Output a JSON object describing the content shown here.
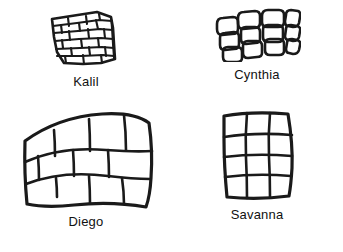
{
  "figure": {
    "background_color": "#ffffff",
    "ink_color": "#1a1a1a",
    "panel_count": 4,
    "panels": [
      {
        "id": "kalil",
        "label": "Kalil",
        "position": "top-left",
        "drawing": "hand-drawn tilted brick wall grid",
        "size": "small",
        "rows": 5,
        "columns": 4,
        "tile_style": "irregular rectangular bricks, offset rows, slanted",
        "label_position": "below"
      },
      {
        "id": "cynthia",
        "label": "Cynthia",
        "position": "top-right",
        "drawing": "hand-drawn skewed grid of rounded tiles in perspective",
        "size": "small",
        "rows": 3,
        "columns": 4,
        "tile_style": "rounded pebble-like tiles, sheared parallelogram layout",
        "label_position": "below"
      },
      {
        "id": "diego",
        "label": "Diego",
        "position": "bottom-left",
        "drawing": "hand-drawn large wavy brick wall grid",
        "size": "large",
        "rows": 3,
        "columns": 4,
        "tile_style": "large wavy rectangular bricks, offset rows",
        "label_position": "below"
      },
      {
        "id": "savanna",
        "label": "Savanna",
        "position": "bottom-right",
        "drawing": "hand-drawn square lattice grid",
        "size": "medium",
        "rows": 4,
        "columns": 3,
        "tile_style": "aligned square cells, wobbly lines",
        "label_position": "below"
      }
    ]
  }
}
